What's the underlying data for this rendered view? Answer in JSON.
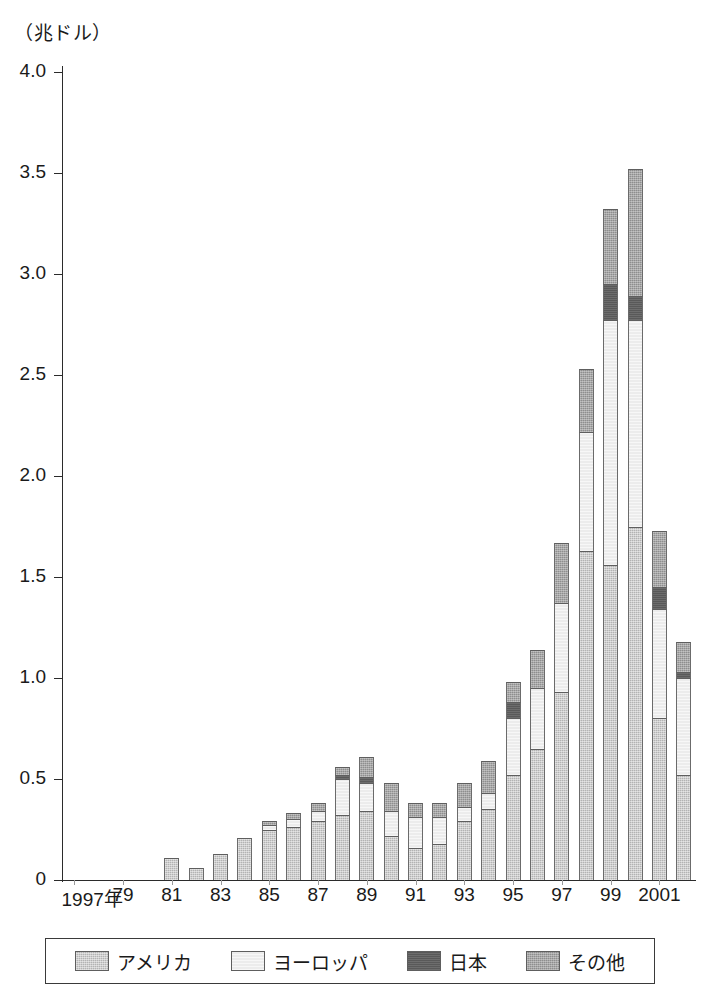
{
  "chart_data": {
    "type": "bar",
    "subtype": "stacked-bar",
    "title": "",
    "unit_caption": "（兆ドル）",
    "ylabel": "",
    "xlabel": "",
    "ylim": [
      0,
      4.0
    ],
    "yticks": [
      "0",
      "0.5",
      "1.0",
      "1.5",
      "2.0",
      "2.5",
      "3.0",
      "3.5",
      "4.0"
    ],
    "ytick_values": [
      0,
      0.5,
      1.0,
      1.5,
      2.0,
      2.5,
      3.0,
      3.5,
      4.0
    ],
    "grid": false,
    "legend_position": "bottom",
    "categories": [
      "1997年",
      "78",
      "79",
      "80",
      "81",
      "82",
      "83",
      "84",
      "85",
      "86",
      "87",
      "88",
      "89",
      "90",
      "91",
      "92",
      "93",
      "94",
      "95",
      "96",
      "97",
      "98",
      "99",
      "2000",
      "2001",
      "2002"
    ],
    "xtick_labels": [
      {
        "label": "1997年",
        "index": 0
      },
      {
        "label": "79",
        "index": 2
      },
      {
        "label": "81",
        "index": 4
      },
      {
        "label": "83",
        "index": 6
      },
      {
        "label": "85",
        "index": 8
      },
      {
        "label": "87",
        "index": 10
      },
      {
        "label": "89",
        "index": 12
      },
      {
        "label": "91",
        "index": 14
      },
      {
        "label": "93",
        "index": 16
      },
      {
        "label": "95",
        "index": 18
      },
      {
        "label": "97",
        "index": 20
      },
      {
        "label": "99",
        "index": 22
      },
      {
        "label": "2001",
        "index": 24
      }
    ],
    "series": [
      {
        "name": "アメリカ",
        "key": "america",
        "color": "#b3b3b3",
        "values": [
          0,
          0,
          0,
          0,
          0.11,
          0.06,
          0.13,
          0.21,
          0.25,
          0.26,
          0.29,
          0.32,
          0.34,
          0.22,
          0.16,
          0.18,
          0.29,
          0.35,
          0.52,
          0.65,
          0.93,
          1.63,
          1.56,
          1.75,
          0.8,
          0.52
        ]
      },
      {
        "name": "ヨーロッパ",
        "key": "europe",
        "color": "#ececec",
        "values": [
          0,
          0,
          0,
          0,
          0,
          0,
          0,
          0,
          0.02,
          0.04,
          0.05,
          0.18,
          0.14,
          0.12,
          0.15,
          0.13,
          0.07,
          0.08,
          0.28,
          0.3,
          0.44,
          0.59,
          1.21,
          1.02,
          0.54,
          0.48
        ]
      },
      {
        "name": "日本",
        "key": "japan",
        "color": "#595959",
        "values": [
          0,
          0,
          0,
          0,
          0,
          0,
          0,
          0,
          0,
          0,
          0,
          0.02,
          0.03,
          0,
          0,
          0,
          0,
          0,
          0.08,
          0,
          0,
          0,
          0.18,
          0.12,
          0.11,
          0.03
        ]
      },
      {
        "name": "その他",
        "key": "other",
        "color": "#8e8e8e",
        "values": [
          0,
          0,
          0,
          0,
          0,
          0,
          0,
          0,
          0.02,
          0.03,
          0.04,
          0.04,
          0.1,
          0.14,
          0.07,
          0.07,
          0.12,
          0.16,
          0.1,
          0.19,
          0.3,
          0.31,
          0.37,
          0.63,
          0.28,
          0.15
        ]
      }
    ],
    "totals": [
      0,
      0,
      0,
      0,
      0.11,
      0.06,
      0.13,
      0.21,
      0.29,
      0.33,
      0.38,
      0.56,
      0.61,
      0.48,
      0.38,
      0.38,
      0.48,
      0.59,
      0.98,
      1.14,
      1.67,
      2.53,
      3.32,
      3.52,
      1.73,
      1.18
    ]
  },
  "legend": {
    "items": [
      {
        "label": "アメリカ",
        "key": "america"
      },
      {
        "label": "ヨーロッパ",
        "key": "europe"
      },
      {
        "label": "日本",
        "key": "japan"
      },
      {
        "label": "その他",
        "key": "other"
      }
    ]
  }
}
